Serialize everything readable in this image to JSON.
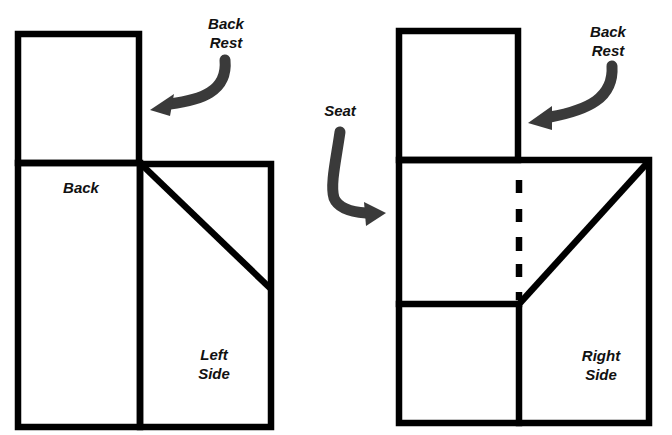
{
  "diagram": {
    "stroke_color": "#000000",
    "arrow_color": "#3a3a3a",
    "background": "#ffffff",
    "panels": {
      "left": {
        "back_rest": {
          "x1": 18,
          "y1": 34,
          "x2": 139,
          "y2": 163
        },
        "back": {
          "x1": 18,
          "y1": 163,
          "x2": 140,
          "y2": 427
        },
        "side": {
          "x1": 140,
          "y1": 164,
          "x2": 271,
          "y2": 427
        },
        "diagonal": {
          "x1": 141,
          "y1": 164,
          "x2": 271,
          "y2": 289
        }
      },
      "right": {
        "back_rest": {
          "x1": 399,
          "y1": 31,
          "x2": 518,
          "y2": 160
        },
        "seat_top": {
          "x1": 399,
          "y1": 160,
          "x2": 649,
          "y2": 160
        },
        "outer": {
          "x1": 399,
          "y1": 160,
          "x2": 649,
          "y2": 423
        },
        "divider_h": {
          "x1": 399,
          "y1": 304,
          "x2": 519,
          "y2": 304
        },
        "divider_v": {
          "x1": 519,
          "y1": 304,
          "x2": 519,
          "y2": 423
        },
        "dashes": [
          {
            "y1": 180,
            "y2": 193
          },
          {
            "y1": 209,
            "y2": 222
          },
          {
            "y1": 237,
            "y2": 251
          },
          {
            "y1": 264,
            "y2": 277
          },
          {
            "y1": 292,
            "y2": 300
          }
        ],
        "dash_x": 519,
        "diagonal": {
          "x1": 649,
          "y1": 161,
          "x2": 520,
          "y2": 303
        }
      }
    },
    "labels": {
      "left_back_rest": {
        "line1": "Back",
        "line2": "Rest",
        "x": 226,
        "y": 14
      },
      "left_back": {
        "line1": "Back",
        "x": 81,
        "y": 178
      },
      "left_side": {
        "line1": "Left",
        "line2": "Side",
        "x": 214,
        "y": 345
      },
      "seat": {
        "line1": "Seat",
        "x": 340,
        "y": 101
      },
      "right_back_rest": {
        "line1": "Back",
        "line2": "Rest",
        "x": 608,
        "y": 22
      },
      "right_side": {
        "line1": "Right",
        "line2": "Side",
        "x": 601,
        "y": 346
      }
    },
    "arrows": {
      "left_back_rest": {
        "path": "M225,60 C228,92 200,100 170,104",
        "tip": "150,110 174,94 170,116"
      },
      "seat": {
        "path": "M340,132 C336,160 330,185 334,198 C338,208 352,212 366,213",
        "tip": "386,213 364,202 366,226"
      },
      "right_back_rest": {
        "path": "M612,66 C614,98 588,110 550,117",
        "tip": "528,123 552,106 552,130"
      }
    }
  }
}
